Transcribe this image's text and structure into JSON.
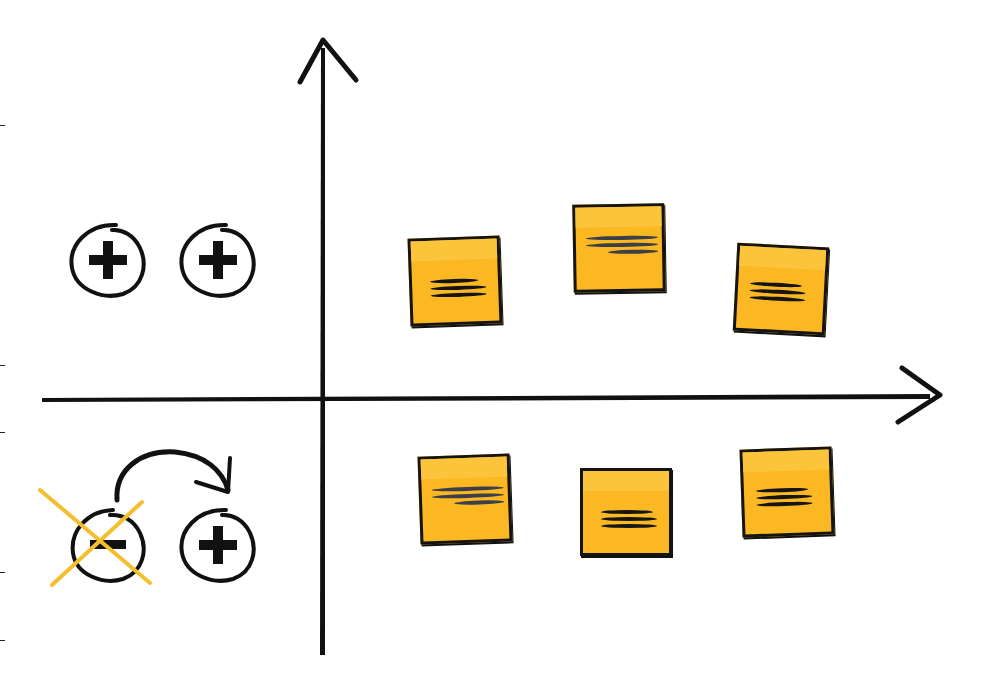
{
  "diagram": {
    "type": "quadrant-matrix",
    "colors": {
      "axis": "#111111",
      "note_fill": "#fbb823",
      "note_border": "#141414",
      "cross_mark": "#f4bf2e"
    },
    "axes": {
      "vertical": {
        "x": 322,
        "y_top": 40,
        "y_bottom": 655,
        "arrow": "up"
      },
      "horizontal": {
        "y": 396,
        "x_left": 42,
        "x_right": 940,
        "arrow": "right"
      }
    },
    "left_icons": {
      "top_row": [
        {
          "icon": "plus-circle-icon",
          "cx": 108,
          "cy": 260
        },
        {
          "icon": "plus-circle-icon",
          "cx": 218,
          "cy": 260
        }
      ],
      "bottom_row": [
        {
          "icon": "minus-circle-icon",
          "cx": 108,
          "cy": 545,
          "crossed_out": true
        },
        {
          "icon": "curved-arrow-icon",
          "from": "minus",
          "to": "plus"
        },
        {
          "icon": "plus-circle-icon",
          "cx": 218,
          "cy": 545
        }
      ]
    },
    "sticky_notes": [
      {
        "quadrant": "top-right",
        "x": 409,
        "y": 237,
        "rotate": -2,
        "style": "dash"
      },
      {
        "quadrant": "top-right",
        "x": 573,
        "y": 204,
        "rotate": -1,
        "style": "wave"
      },
      {
        "quadrant": "top-right",
        "x": 735,
        "y": 245,
        "rotate": 3,
        "style": "dash"
      },
      {
        "quadrant": "bottom-right",
        "x": 419,
        "y": 455,
        "rotate": -2,
        "style": "wave"
      },
      {
        "quadrant": "bottom-right",
        "x": 580,
        "y": 468,
        "rotate": 0,
        "style": "dash"
      },
      {
        "quadrant": "bottom-right",
        "x": 741,
        "y": 448,
        "rotate": -2,
        "style": "dash"
      }
    ],
    "edge_ticks_y": [
      125,
      365,
      432,
      572,
      640
    ]
  }
}
